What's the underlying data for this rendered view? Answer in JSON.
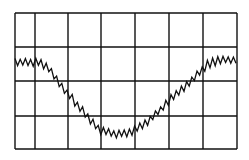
{
  "chart_data": {
    "type": "line",
    "title": "",
    "xlabel": "",
    "ylabel": "",
    "grid": true,
    "grid_divisions": {
      "x": 7,
      "y": 4
    },
    "x_grid_px": [
      15,
      35,
      68,
      101,
      135,
      169,
      203,
      237
    ],
    "y_grid_px": [
      13,
      47,
      81,
      116,
      149
    ],
    "series": [
      {
        "name": "trace",
        "baseline_points_px": [
          [
            15,
            62
          ],
          [
            40,
            62
          ],
          [
            50,
            70
          ],
          [
            60,
            85
          ],
          [
            75,
            102
          ],
          [
            90,
            120
          ],
          [
            100,
            130
          ],
          [
            115,
            134
          ],
          [
            130,
            132
          ],
          [
            145,
            124
          ],
          [
            160,
            110
          ],
          [
            175,
            95
          ],
          [
            190,
            82
          ],
          [
            200,
            72
          ],
          [
            208,
            64
          ],
          [
            220,
            60
          ],
          [
            237,
            60
          ]
        ],
        "noise_amplitude_px": 9,
        "zigzag_step_px": 2.6
      }
    ],
    "colors": {
      "trace": "#111111",
      "grid": "#111111",
      "background": "#ffffff"
    }
  }
}
